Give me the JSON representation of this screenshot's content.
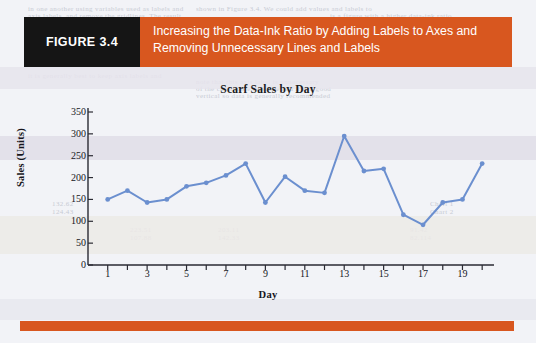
{
  "figure": {
    "tag": "FIGURE 3.4",
    "title_line1": "Increasing the Data-Ink Ratio by Adding Labels to Axes and",
    "title_line2": "Removing Unnecessary Lines and Labels",
    "tag_bg": "#151515",
    "banner_bg": "#d8571f",
    "banner_fg": "#ffffff",
    "rule_color": "#d8571f",
    "page_bg": "#f2f3f7"
  },
  "ghost_text": [
    {
      "text": "in one another using variables used as labels and",
      "x": 28,
      "y": 5
    },
    {
      "text": "shown in Figure 3.4. We could add values and labels to",
      "x": 196,
      "y": 5
    },
    {
      "text": "axis labels, and remove the gridlines. The result",
      "x": 28,
      "y": 12
    },
    {
      "text": "is a figure with a higher data-ink ratio.",
      "x": 330,
      "y": 12
    },
    {
      "text": "it is generally best to keep axis labels and",
      "x": 28,
      "y": 72
    },
    {
      "text": "note that this axis label is unnecessary",
      "x": 196,
      "y": 78
    },
    {
      "text": "of the chart more readable and it is a good",
      "x": 196,
      "y": 85
    },
    {
      "text": "vertical so data is generally recommended",
      "x": 196,
      "y": 92
    },
    {
      "text": "132.62",
      "x": 52,
      "y": 200
    },
    {
      "text": "124.43",
      "x": 52,
      "y": 208
    },
    {
      "text": "Chart 1",
      "x": 430,
      "y": 200
    },
    {
      "text": "Chart 2",
      "x": 430,
      "y": 208
    },
    {
      "text": "223.51",
      "x": 130,
      "y": 226
    },
    {
      "text": "203.11",
      "x": 218,
      "y": 226
    },
    {
      "text": "91.42",
      "x": 410,
      "y": 226
    },
    {
      "text": "107.88",
      "x": 130,
      "y": 234
    },
    {
      "text": "142.33",
      "x": 218,
      "y": 234
    },
    {
      "text": "82.114",
      "x": 410,
      "y": 234
    }
  ],
  "bands": [
    {
      "top": 67,
      "height": 22,
      "color": "#e6e4ec"
    },
    {
      "top": 136,
      "height": 24,
      "color": "#e0dde8"
    },
    {
      "top": 216,
      "height": 38,
      "color": "#eceae6"
    },
    {
      "top": 299,
      "height": 21,
      "color": "#e7e8ee"
    }
  ],
  "chart_data": {
    "type": "line",
    "title": "Scarf Sales by Day",
    "xlabel": "Day",
    "ylabel": "Sales (Units)",
    "x": [
      1,
      2,
      3,
      4,
      5,
      6,
      7,
      8,
      9,
      10,
      11,
      12,
      13,
      14,
      15,
      16,
      17,
      18,
      19,
      20
    ],
    "values": [
      150,
      170,
      143,
      150,
      180,
      188,
      205,
      232,
      143,
      202,
      170,
      165,
      295,
      215,
      220,
      115,
      92,
      143,
      150,
      232
    ],
    "series": [
      {
        "name": "Scarf Sales",
        "values": [
          150,
          170,
          143,
          150,
          180,
          188,
          205,
          232,
          143,
          202,
          170,
          165,
          295,
          215,
          220,
          115,
          92,
          143,
          150,
          232
        ]
      }
    ],
    "xlim": [
      0,
      20.6
    ],
    "ylim": [
      0,
      350
    ],
    "ytick_values": [
      0,
      50,
      100,
      150,
      200,
      250,
      300,
      350
    ],
    "ytick_labels": [
      "0",
      "50",
      "100",
      "150",
      "200",
      "250",
      "300",
      "350"
    ],
    "xtick_values": [
      1,
      2,
      3,
      4,
      5,
      6,
      7,
      8,
      9,
      10,
      11,
      12,
      13,
      14,
      15,
      16,
      17,
      18,
      19,
      20
    ],
    "xtick_labels": [
      "1",
      "",
      "3",
      "",
      "5",
      "",
      "7",
      "",
      "9",
      "",
      "11",
      "",
      "13",
      "",
      "15",
      "",
      "17",
      "",
      "19",
      ""
    ],
    "grid": false,
    "legend": "none",
    "line_color": "#6b8fcf",
    "marker_color": "#6b8fcf",
    "axis_color": "#2a2a33",
    "plot_bg": "#f2f3f7"
  }
}
